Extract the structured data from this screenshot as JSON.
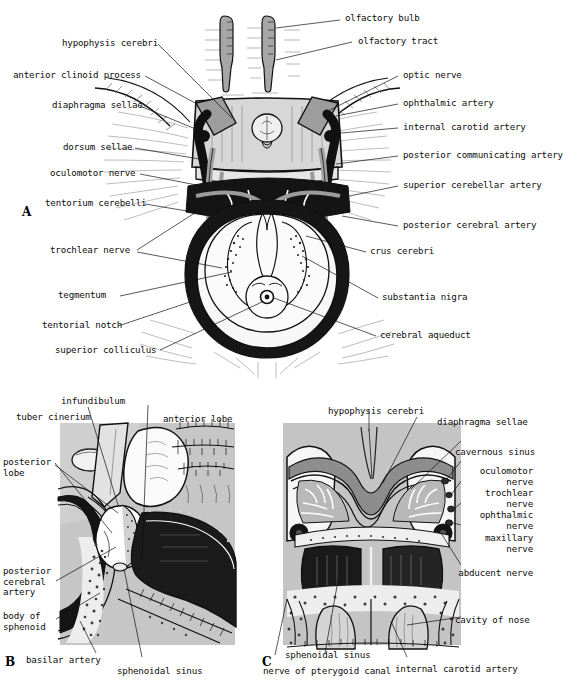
{
  "figure": {
    "panels": [
      {
        "id": "A",
        "letter": "A",
        "caption": "superior view of sella turcica, midbrain and tentorium cerebelli"
      },
      {
        "id": "B",
        "letter": "B",
        "caption": "sagittal section through hypophysis cerebri and sphenoidal sinus"
      },
      {
        "id": "C",
        "letter": "C",
        "caption": "coronal section through hypophysis cerebri and cavernous sinuses"
      }
    ]
  },
  "panel_a": {
    "letter": "A",
    "labels_left": [
      {
        "text": "hypophysis cerebri"
      },
      {
        "text": "anterior clinoid process"
      },
      {
        "text": "diaphragma sellae"
      },
      {
        "text": "dorsum sellae"
      },
      {
        "text": "oculomotor nerve"
      },
      {
        "text": "tentorium cerebelli"
      },
      {
        "text": "trochlear nerve"
      },
      {
        "text": "tegmentum"
      },
      {
        "text": "tentorial notch"
      },
      {
        "text": "superior colliculus"
      }
    ],
    "labels_right": [
      {
        "text": "olfactory bulb"
      },
      {
        "text": "olfactory tract"
      },
      {
        "text": "optic nerve"
      },
      {
        "text": "ophthalmic artery"
      },
      {
        "text": "internal carotid artery"
      },
      {
        "text": "posterior communicating artery"
      },
      {
        "text": "superior cerebellar artery"
      },
      {
        "text": "posterior cerebral artery"
      },
      {
        "text": "crus cerebri"
      },
      {
        "text": "substantia nigra"
      },
      {
        "text": "cerebral aqueduct"
      }
    ]
  },
  "panel_b": {
    "letter": "B",
    "labels": [
      {
        "text": "infundibulum"
      },
      {
        "text": "tuber cinerium"
      },
      {
        "text": "anterior lobe"
      },
      {
        "text": "posterior lobe"
      },
      {
        "text": "posterior cerebral artery"
      },
      {
        "text": "body of sphenoid"
      },
      {
        "text": "basilar artery"
      },
      {
        "text": "sphenoidal sinus"
      }
    ]
  },
  "panel_c": {
    "letter": "C",
    "labels": [
      {
        "text": "hypophysis cerebri"
      },
      {
        "text": "diaphragma sellae"
      },
      {
        "text": "cavernous sinus"
      },
      {
        "text": "oculomotor nerve"
      },
      {
        "text": "trochlear nerve"
      },
      {
        "text": "ophthalmic nerve"
      },
      {
        "text": "maxillary nerve"
      },
      {
        "text": "abducent nerve"
      },
      {
        "text": "cavity of nose"
      },
      {
        "text": "sphenoidal sinus"
      },
      {
        "text": "internal carotid artery"
      },
      {
        "text": "nerve of pterygoid canal"
      }
    ]
  },
  "colors": {
    "ink": "#111111",
    "paper": "#ffffff",
    "tissue_light": "#cfcfcf",
    "tissue_mid": "#9a9a9a",
    "bone_fill": "#e8e8e8",
    "dark_fill": "#1a1a1a"
  }
}
